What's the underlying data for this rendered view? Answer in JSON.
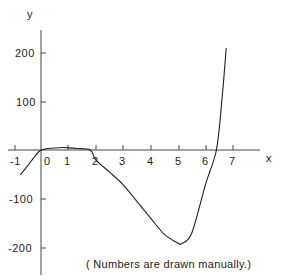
{
  "chart_data": {
    "type": "line",
    "title": "",
    "xlabel": "x",
    "ylabel": "y",
    "xlim": [
      -1,
      7.8
    ],
    "ylim": [
      -250,
      250
    ],
    "grid": false,
    "legend": null,
    "x_ticks": [
      -1,
      0,
      1,
      2,
      3,
      4,
      5,
      6,
      7
    ],
    "x_tick_labels": [
      "-1",
      "0",
      "1",
      "2",
      "3",
      "4",
      "5",
      "6",
      "7"
    ],
    "y_ticks": [
      200,
      100,
      -100,
      -200
    ],
    "y_tick_labels": [
      "200",
      "100",
      "-100",
      "-200"
    ],
    "series": [
      {
        "name": "curve",
        "x": [
          -0.76,
          -0.5,
          -0.25,
          0,
          0.5,
          0.9,
          1.3,
          1.8,
          2,
          2.5,
          3,
          3.5,
          4,
          4.5,
          5,
          5.13,
          5.5,
          6,
          6.4,
          6.6,
          6.76
        ],
        "y": [
          -51,
          -33,
          -15,
          0,
          4,
          5,
          3,
          0,
          -20,
          -45,
          -71,
          -105,
          -139,
          -172,
          -190,
          -191,
          -170,
          -71,
          0,
          100,
          208
        ]
      }
    ],
    "annotations": [
      "( Numbers are drawn manually.)"
    ]
  },
  "labels": {
    "x_axis": "x",
    "y_axis": "y",
    "note": "( Numbers are drawn manually.)",
    "x_ticks": [
      "-1",
      "0",
      "1",
      "2",
      "3",
      "4",
      "5",
      "6",
      "7"
    ],
    "y_ticks": [
      "200",
      "100",
      "-100",
      "-200"
    ]
  }
}
